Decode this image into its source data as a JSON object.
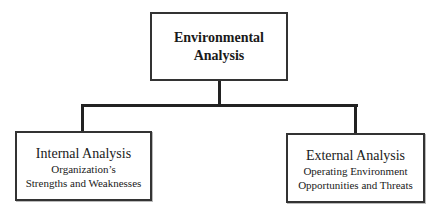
{
  "diagram": {
    "type": "hierarchy",
    "root": {
      "title": "Environmental Analysis"
    },
    "children": [
      {
        "title": "Internal Analysis",
        "subtitle_line1": "Organization’s",
        "subtitle_line2": "Strengths and Weaknesses"
      },
      {
        "title": "External Analysis",
        "subtitle_line1": "Operating Environment",
        "subtitle_line2": "Opportunities and Threats"
      }
    ],
    "colors": {
      "border": "#333333",
      "connector": "#222222",
      "background": "#ffffff",
      "text": "#1a1a1a"
    }
  }
}
